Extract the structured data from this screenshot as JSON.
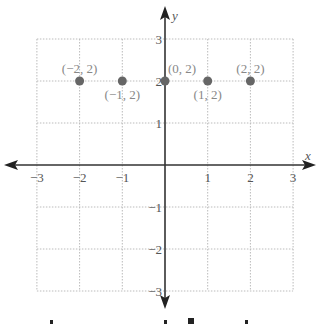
{
  "chart_data": {
    "type": "scatter",
    "title": "",
    "xlabel": "x",
    "ylabel": "y",
    "xlim": [
      -3,
      3
    ],
    "ylim": [
      -3,
      3
    ],
    "grid": true,
    "x_ticks": [
      -3,
      -2,
      -1,
      1,
      2,
      3
    ],
    "y_ticks": [
      -3,
      -2,
      -1,
      1,
      2,
      3
    ],
    "x_tick_labels": [
      "−3",
      "−2",
      "−1",
      "1",
      "2",
      "3"
    ],
    "y_tick_labels": [
      "−3",
      "−2",
      "−1",
      "1",
      "2",
      "3"
    ],
    "points": [
      {
        "x": -2,
        "y": 2,
        "label": "(−2, 2)",
        "label_pos": "above"
      },
      {
        "x": -1,
        "y": 2,
        "label": "(−1, 2)",
        "label_pos": "below"
      },
      {
        "x": 0,
        "y": 2,
        "label": "(0, 2)",
        "label_pos": "above-right"
      },
      {
        "x": 1,
        "y": 2,
        "label": "(1, 2)",
        "label_pos": "below"
      },
      {
        "x": 2,
        "y": 2,
        "label": "(2, 2)",
        "label_pos": "above"
      }
    ],
    "point_color": "#666666"
  }
}
